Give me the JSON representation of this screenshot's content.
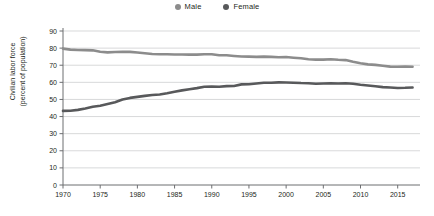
{
  "legend": {
    "position": "top-center",
    "items": [
      {
        "label": "Male",
        "color": "#8c8c8c",
        "marker": "legend-dot-male"
      },
      {
        "label": "Female",
        "color": "#58595b",
        "marker": "legend-dot-female"
      }
    ]
  },
  "axes": {
    "ylabel_line1": "Civilian labor force",
    "ylabel_line2": "(percent of population)",
    "xlabel": "",
    "yticks": [
      0,
      10,
      20,
      30,
      40,
      50,
      60,
      70,
      80,
      90
    ],
    "xticks": [
      1970,
      1975,
      1980,
      1985,
      1990,
      1995,
      2000,
      2005,
      2010,
      2015
    ],
    "ylim": [
      0,
      90
    ],
    "xlim": [
      1970,
      2018
    ],
    "grid": "horizontal"
  },
  "chart_data": {
    "type": "line",
    "title": "",
    "subtitle": "",
    "xlabel": "",
    "ylabel": "Civilian labor force (percent of population)",
    "xlim": [
      1970,
      2018
    ],
    "ylim": [
      0,
      90
    ],
    "grid": true,
    "legend_position": "top-center",
    "x": [
      1970,
      1971,
      1972,
      1973,
      1974,
      1975,
      1976,
      1977,
      1978,
      1979,
      1980,
      1981,
      1982,
      1983,
      1984,
      1985,
      1986,
      1987,
      1988,
      1989,
      1990,
      1991,
      1992,
      1993,
      1994,
      1995,
      1996,
      1997,
      1998,
      1999,
      2000,
      2001,
      2002,
      2003,
      2004,
      2005,
      2006,
      2007,
      2008,
      2009,
      2010,
      2011,
      2012,
      2013,
      2014,
      2015,
      2016,
      2017
    ],
    "series": [
      {
        "name": "Male",
        "color": "#8c8c8c",
        "values": [
          79.7,
          79.1,
          78.9,
          78.8,
          78.7,
          77.9,
          77.5,
          77.7,
          77.9,
          77.8,
          77.4,
          77.0,
          76.6,
          76.4,
          76.4,
          76.3,
          76.3,
          76.2,
          76.2,
          76.4,
          76.4,
          75.8,
          75.8,
          75.4,
          75.1,
          75.0,
          74.9,
          75.0,
          74.9,
          74.7,
          74.8,
          74.4,
          74.1,
          73.5,
          73.3,
          73.3,
          73.5,
          73.2,
          73.0,
          72.0,
          71.2,
          70.5,
          70.2,
          69.7,
          69.2,
          69.1,
          69.2,
          69.1
        ]
      },
      {
        "name": "Female",
        "color": "#58595b",
        "values": [
          43.3,
          43.4,
          43.9,
          44.7,
          45.7,
          46.3,
          47.3,
          48.4,
          50.0,
          50.9,
          51.5,
          52.1,
          52.6,
          52.9,
          53.6,
          54.5,
          55.3,
          56.0,
          56.6,
          57.4,
          57.5,
          57.4,
          57.8,
          57.9,
          58.8,
          58.9,
          59.3,
          59.8,
          59.8,
          60.0,
          59.9,
          59.8,
          59.6,
          59.5,
          59.2,
          59.3,
          59.4,
          59.3,
          59.5,
          59.2,
          58.6,
          58.1,
          57.7,
          57.2,
          57.0,
          56.7,
          56.8,
          57.0
        ]
      }
    ]
  }
}
